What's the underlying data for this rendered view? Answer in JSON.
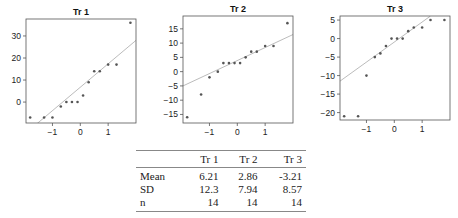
{
  "chart_data": [
    {
      "type": "scatter",
      "title": "Tr 1",
      "xlabel": "",
      "ylabel": "",
      "x": [
        -1.8,
        -1.3,
        -1.0,
        -0.7,
        -0.5,
        -0.3,
        -0.1,
        0.1,
        0.3,
        0.5,
        0.7,
        1.0,
        1.3,
        1.8
      ],
      "values": [
        -7,
        -7,
        -7,
        -2,
        0,
        0,
        0,
        3,
        9,
        14,
        14,
        17,
        17,
        36
      ],
      "xticks": [
        -1,
        0,
        1
      ],
      "yticks": [
        0,
        10,
        20,
        30
      ],
      "xlim": [
        -1.95,
        2.0
      ],
      "ylim": [
        -9.5,
        37.7
      ],
      "reference_line": {
        "x1": -1.95,
        "y1": -14,
        "x2": 2.0,
        "y2": 28
      },
      "grid": false,
      "frame": {
        "left": 26,
        "top": 19,
        "width": 110,
        "height": 104
      }
    },
    {
      "type": "scatter",
      "title": "Tr 2",
      "xlabel": "",
      "ylabel": "",
      "x": [
        -1.8,
        -1.3,
        -1.0,
        -0.7,
        -0.5,
        -0.3,
        -0.1,
        0.1,
        0.3,
        0.5,
        0.7,
        1.0,
        1.3,
        1.8
      ],
      "values": [
        -16,
        -8,
        -2,
        0,
        3,
        3,
        3,
        3,
        5,
        7,
        7,
        9,
        9,
        17
      ],
      "xticks": [
        -1,
        0,
        1
      ],
      "yticks": [
        -15,
        -10,
        -5,
        0,
        5,
        10,
        15
      ],
      "xlim": [
        -1.95,
        2.0
      ],
      "ylim": [
        -18,
        19.5
      ],
      "reference_line": {
        "x1": -1.95,
        "y1": -5,
        "x2": 2.0,
        "y2": 13
      },
      "grid": false,
      "frame": {
        "left": 183,
        "top": 16,
        "width": 110,
        "height": 107
      }
    },
    {
      "type": "scatter",
      "title": "Tr 3",
      "xlabel": "",
      "ylabel": "",
      "x": [
        -1.8,
        -1.3,
        -1.0,
        -0.7,
        -0.5,
        -0.3,
        -0.1,
        0.1,
        0.3,
        0.5,
        0.7,
        1.0,
        1.3,
        1.8
      ],
      "values": [
        -21,
        -21,
        -10,
        -5,
        -4,
        -2,
        0,
        0,
        0,
        2,
        3,
        3,
        5,
        5
      ],
      "xticks": [
        -1,
        0,
        1
      ],
      "yticks": [
        -20,
        -15,
        -10,
        -5,
        0,
        5
      ],
      "xlim": [
        -1.95,
        2.0
      ],
      "ylim": [
        -22,
        6.1
      ],
      "reference_line": {
        "x1": -1.95,
        "y1": -11.5,
        "x2": 1.3,
        "y2": 6.1
      },
      "grid": false,
      "frame": {
        "left": 340,
        "top": 16,
        "width": 110,
        "height": 104
      }
    },
    {
      "type": "table",
      "columns": [
        "",
        "Tr 1",
        "Tr 2",
        "Tr 3"
      ],
      "rows": [
        [
          "Mean",
          "6.21",
          "2.86",
          "-3.21"
        ],
        [
          "SD",
          "12.3",
          "7.94",
          "8.57"
        ],
        [
          "n",
          "14",
          "14",
          "14"
        ]
      ]
    }
  ],
  "colors": {
    "points": "#555555",
    "frame": "#555555",
    "reference_line": "#aaaaaa",
    "text": "#222222"
  },
  "table": {
    "header": [
      "",
      "Tr 1",
      "Tr 2",
      "Tr 3"
    ],
    "rows": [
      {
        "label": "Mean",
        "values": [
          "6.21",
          "2.86",
          "-3.21"
        ]
      },
      {
        "label": "SD",
        "values": [
          "12.3",
          "7.94",
          "8.57"
        ]
      },
      {
        "label": "n",
        "values": [
          "14",
          "14",
          "14"
        ]
      }
    ]
  }
}
